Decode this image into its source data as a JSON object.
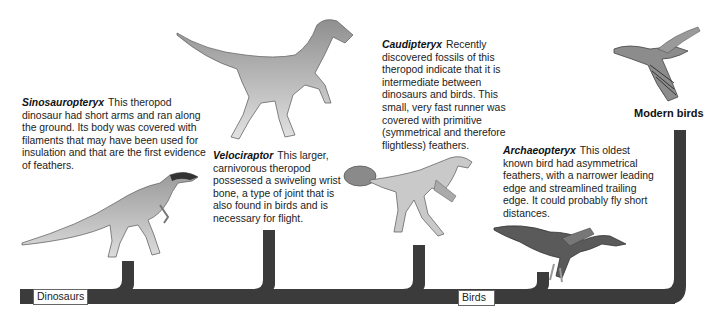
{
  "diagram": {
    "trunk_color": "#3b3b3b",
    "labels": {
      "dinosaurs": "Dinosaurs",
      "birds": "Birds",
      "modern_birds": "Modern birds"
    },
    "taxa": [
      {
        "name": "Sinosauropteryx",
        "description": "This theropod dinosaur had short arms and ran along the ground. Its body was covered with filaments that may have been used for insulation and that are the first evidence of feathers."
      },
      {
        "name": "Velociraptor",
        "description": "This larger, carnivorous theropod possessed a swiveling wrist bone, a type of joint that is also found in birds and is necessary for flight."
      },
      {
        "name": "Caudipteryx",
        "description": "Recently discovered fossils of this theropod indicate that it is intermediate between dinosaurs and birds. This small, very fast runner was covered with primitive (symmetrical and therefore flightless) feathers."
      },
      {
        "name": "Archaeopteryx",
        "description": "This oldest known bird had asymmetrical feathers, with a narrower leading edge and streamlined trailing edge. It could probably fly short distances."
      },
      {
        "name": "Modern birds",
        "description": ""
      }
    ]
  }
}
